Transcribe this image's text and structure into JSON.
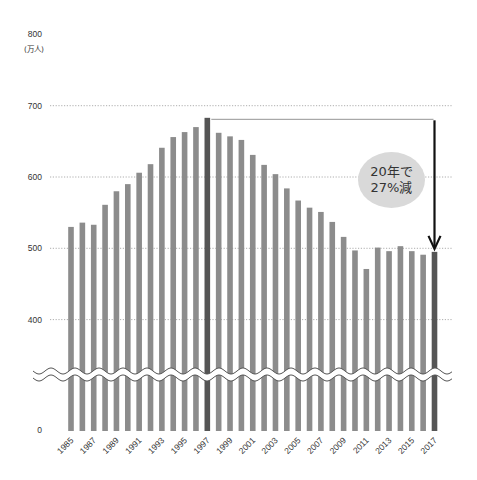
{
  "chart_data": {
    "type": "bar",
    "title": "",
    "xlabel": "",
    "ylabel": "(万人)",
    "unit_label": "(万人)",
    "ylim": [
      0,
      800
    ],
    "y_axis_break": {
      "between": [
        0,
        400
      ],
      "style": "wavy"
    },
    "y_ticks": [
      0,
      400,
      500,
      600,
      700,
      800
    ],
    "grid": "dotted horizontal at 400, 500, 600, 700",
    "legend": null,
    "categories": [
      "1985",
      "1986",
      "1987",
      "1988",
      "1989",
      "1990",
      "1991",
      "1992",
      "1993",
      "1994",
      "1995",
      "1996",
      "1997",
      "1998",
      "1999",
      "2000",
      "2001",
      "2002",
      "2003",
      "2004",
      "2005",
      "2006",
      "2007",
      "2008",
      "2009",
      "2010",
      "2011",
      "2012",
      "2013",
      "2014",
      "2015",
      "2016",
      "2017"
    ],
    "x_tick_labels": [
      "1985",
      "1987",
      "1989",
      "1991",
      "1993",
      "1995",
      "1997",
      "1999",
      "2001",
      "2003",
      "2005",
      "2007",
      "2009",
      "2011",
      "2013",
      "2015",
      "2017"
    ],
    "series": [
      {
        "name": "value",
        "values": [
          530,
          536,
          533,
          561,
          580,
          590,
          606,
          618,
          641,
          656,
          663,
          670,
          683,
          662,
          657,
          652,
          631,
          617,
          604,
          584,
          567,
          557,
          551,
          537,
          516,
          497,
          471,
          501,
          496,
          503,
          496,
          491,
          495
        ]
      }
    ],
    "highlighted_bars": [
      "1997",
      "2017"
    ],
    "colors": {
      "bar": "#8c8c8c",
      "bar_highlight": "#555555",
      "grid": "#999999",
      "arrow": "#111111",
      "bubble": "#d9d9d9",
      "reference_line": "#888888"
    },
    "annotations": [
      {
        "type": "reference_line",
        "from": "1997",
        "to": "2017",
        "value": 683
      },
      {
        "type": "arrow",
        "at": "2017",
        "from_value": 683,
        "to_value": 495
      },
      {
        "type": "bubble",
        "lines": [
          "20年で",
          "27%減"
        ]
      }
    ]
  }
}
